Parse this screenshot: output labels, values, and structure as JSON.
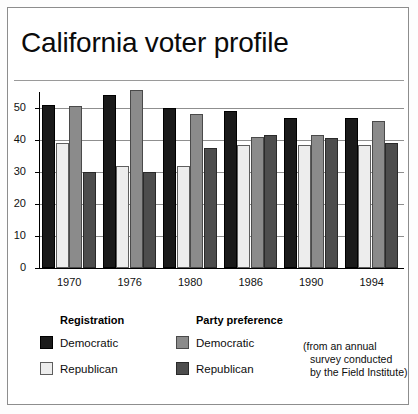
{
  "figure": {
    "title": "California voter profile",
    "source_note_lines": [
      "(from an annual",
      "survey conducted",
      "by the Field Institute)"
    ]
  },
  "legend": {
    "groups": [
      {
        "heading": "Registration",
        "entries": [
          {
            "label": "Democratic",
            "swatch": "reg-dem",
            "color": "#1a1a1a"
          },
          {
            "label": "Republican",
            "swatch": "reg-rep",
            "color": "#ededed"
          }
        ]
      },
      {
        "heading": "Party preference",
        "entries": [
          {
            "label": "Democratic",
            "swatch": "pref-dem",
            "color": "#8b8b8b"
          },
          {
            "label": "Republican",
            "swatch": "pref-rep",
            "color": "#4d4d4d"
          }
        ]
      }
    ]
  },
  "chart_data": {
    "type": "bar",
    "title": "California voter profile",
    "xlabel": "",
    "ylabel": "",
    "ylim": [
      0,
      55
    ],
    "yticks": [
      0,
      10,
      20,
      30,
      40,
      50
    ],
    "grid": true,
    "legend_position": "bottom",
    "categories": [
      "1970",
      "1976",
      "1980",
      "1986",
      "1990",
      "1994"
    ],
    "series": [
      {
        "name": "Registration Democratic",
        "color": "#1a1a1a",
        "values": [
          51,
          54,
          50,
          49,
          47,
          47
        ]
      },
      {
        "name": "Registration Republican",
        "color": "#ededed",
        "values": [
          39,
          32,
          32,
          38.5,
          38.5,
          38.5
        ]
      },
      {
        "name": "Party preference Democratic",
        "color": "#8b8b8b",
        "values": [
          50.5,
          55.5,
          48,
          41,
          41.5,
          46
        ]
      },
      {
        "name": "Party preference Republican",
        "color": "#4d4d4d",
        "values": [
          30,
          30,
          37.5,
          41.5,
          40.5,
          39
        ]
      }
    ],
    "annotation": "(from an annual survey conducted by the Field Institute)"
  }
}
